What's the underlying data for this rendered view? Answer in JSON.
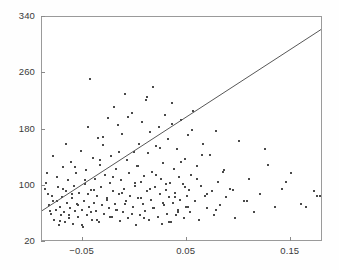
{
  "chart_data": {
    "type": "scatter",
    "title": "",
    "subtitle": "",
    "xlabel": "",
    "ylabel": "",
    "grid": false,
    "legend": null,
    "xlim": [
      -0.089,
      0.181
    ],
    "ylim": [
      20,
      340
    ],
    "xticks": [
      -0.05,
      0.05,
      0.15
    ],
    "xticklabels": [
      "−0.05",
      "0.05",
      "0.15"
    ],
    "yticks": [
      20,
      100,
      180,
      260,
      340
    ],
    "yticklabels": [
      "20",
      "100",
      "180",
      "260",
      "340"
    ],
    "marker": {
      "shape": "square",
      "size_px": 2,
      "color": "#4a4a4a"
    },
    "series": [
      {
        "name": "observations",
        "n_points": 233,
        "x": [
          -0.086,
          -0.085,
          -0.083,
          -0.082,
          -0.08,
          -0.079,
          -0.078,
          -0.077,
          -0.076,
          -0.075,
          -0.074,
          -0.073,
          -0.072,
          -0.071,
          -0.07,
          -0.069,
          -0.068,
          -0.067,
          -0.066,
          -0.065,
          -0.064,
          -0.063,
          -0.062,
          -0.061,
          -0.06,
          -0.059,
          -0.058,
          -0.057,
          -0.056,
          -0.055,
          -0.054,
          -0.053,
          -0.052,
          -0.051,
          -0.05,
          -0.049,
          -0.048,
          -0.047,
          -0.046,
          -0.045,
          -0.044,
          -0.043,
          -0.042,
          -0.041,
          -0.04,
          -0.039,
          -0.038,
          -0.037,
          -0.036,
          -0.035,
          -0.034,
          -0.033,
          -0.032,
          -0.031,
          -0.03,
          -0.029,
          -0.028,
          -0.027,
          -0.026,
          -0.025,
          -0.024,
          -0.023,
          -0.022,
          -0.021,
          -0.02,
          -0.019,
          -0.018,
          -0.017,
          -0.016,
          -0.015,
          -0.014,
          -0.013,
          -0.012,
          -0.011,
          -0.01,
          -0.009,
          -0.008,
          -0.007,
          -0.006,
          -0.005,
          -0.004,
          -0.003,
          -0.002,
          -0.001,
          0.0,
          0.001,
          0.002,
          0.003,
          0.004,
          0.005,
          0.006,
          0.007,
          0.008,
          0.009,
          0.01,
          0.011,
          0.012,
          0.013,
          0.014,
          0.015,
          0.016,
          0.017,
          0.018,
          0.019,
          0.02,
          0.021,
          0.022,
          0.023,
          0.024,
          0.025,
          0.026,
          0.027,
          0.028,
          0.029,
          0.03,
          0.031,
          0.032,
          0.033,
          0.034,
          0.035,
          0.036,
          0.037,
          0.038,
          0.039,
          0.04,
          0.041,
          0.042,
          0.043,
          0.044,
          0.045,
          0.046,
          0.047,
          0.048,
          0.049,
          0.05,
          0.051,
          0.052,
          0.053,
          0.054,
          0.056,
          0.058,
          0.06,
          0.062,
          0.064,
          0.066,
          0.068,
          0.07,
          0.072,
          0.074,
          0.076,
          0.078,
          0.08,
          0.082,
          0.085,
          0.088,
          0.092,
          0.096,
          0.1,
          0.105,
          0.11,
          0.115,
          0.12,
          0.128,
          0.135,
          0.142,
          0.15,
          0.16,
          0.172,
          0.178,
          -0.084,
          -0.081,
          -0.078,
          -0.075,
          -0.072,
          -0.069,
          -0.066,
          -0.063,
          -0.06,
          -0.057,
          -0.054,
          -0.051,
          -0.048,
          -0.045,
          -0.042,
          -0.039,
          -0.036,
          -0.033,
          -0.03,
          -0.027,
          -0.024,
          -0.021,
          -0.018,
          -0.015,
          -0.012,
          -0.009,
          -0.006,
          -0.003,
          0.0,
          0.003,
          0.006,
          0.009,
          0.012,
          0.015,
          0.018,
          0.021,
          0.024,
          0.027,
          0.03,
          0.033,
          0.036,
          0.039,
          0.042,
          0.045,
          0.048,
          0.051,
          0.055,
          0.06,
          0.065,
          0.07,
          0.078,
          0.086,
          0.095,
          0.108,
          0.125,
          0.145,
          0.165,
          0.175
        ],
        "y": [
          96,
          104,
          88,
          72,
          60,
          86,
          78,
          52,
          66,
          112,
          98,
          44,
          70,
          58,
          84,
          126,
          62,
          48,
          92,
          76,
          108,
          54,
          68,
          134,
          82,
          46,
          100,
          64,
          118,
          74,
          56,
          90,
          150,
          66,
          42,
          78,
          102,
          122,
          58,
          88,
          70,
          252,
          94,
          52,
          140,
          76,
          110,
          64,
          86,
          168,
          48,
          130,
          98,
          72,
          158,
          60,
          116,
          82,
          196,
          68,
          104,
          142,
          56,
          92,
          212,
          74,
          124,
          66,
          186,
          88,
          50,
          108,
          174,
          62,
          96,
          230,
          78,
          136,
          54,
          118,
          86,
          204,
          70,
          148,
          100,
          44,
          128,
          82,
          160,
          58,
          106,
          190,
          74,
          114,
          64,
          222,
          92,
          146,
          52,
          176,
          80,
          120,
          240,
          68,
          98,
          156,
          56,
          184,
          88,
          110,
          46,
          132,
          72,
          200,
          94,
          60,
          166,
          84,
          104,
          48,
          218,
          76,
          124,
          90,
          58,
          152,
          66,
          112,
          80,
          194,
          102,
          54,
          138,
          70,
          86,
          172,
          94,
          62,
          116,
          206,
          78,
          128,
          52,
          100,
          160,
          86,
          68,
          144,
          92,
          58,
          178,
          106,
          72,
          120,
          84,
          96,
          54,
          164,
          78,
          110,
          62,
          88,
          130,
          70,
          96,
          118,
          74,
          92,
          86,
          118,
          64,
          142,
          78,
          50,
          96,
          160,
          58,
          88,
          126,
          72,
          44,
          108,
          184,
          62,
          94,
          52,
          136,
          170,
          80,
          56,
          112,
          66,
          148,
          90,
          74,
          198,
          60,
          104,
          128,
          82,
          54,
          226,
          96,
          68,
          116,
          154,
          76,
          102,
          48,
          188,
          84,
          62,
          134,
          98,
          70,
          180,
          110,
          144,
          88,
          66,
          122,
          94,
          78,
          152,
          106,
          70,
          86
        ],
        "x_note": "explanatory variable, linear axis",
        "y_note": "response variable, linear axis"
      }
    ],
    "fit_line": {
      "name": "least-squares fit",
      "color": "#555555",
      "width_px": 1,
      "x_start": -0.089,
      "y_start": 62,
      "x_end": 0.181,
      "y_end": 322,
      "slope": 963,
      "intercept": 148
    }
  }
}
